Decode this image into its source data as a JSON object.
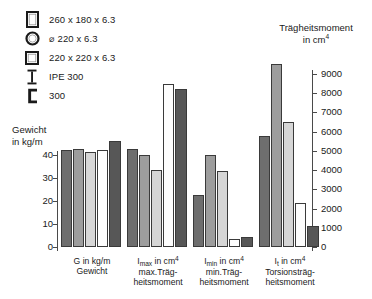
{
  "legend": {
    "items": [
      {
        "icon": "rect-hollow-tube-icon",
        "label": "260 x 180 x 6.3"
      },
      {
        "icon": "round-hollow-tube-icon",
        "label": "⌀ 220 x 6.3"
      },
      {
        "icon": "square-hollow-tube-icon",
        "label": "220 x 220 x 6.3"
      },
      {
        "icon": "i-beam-icon",
        "label": "IPE 300"
      },
      {
        "icon": "c-channel-icon",
        "label": "300"
      }
    ]
  },
  "axes": {
    "left": {
      "title_line1": "Gewicht",
      "title_line2": "in kg/m",
      "ticks": [
        "0",
        "10",
        "20",
        "30",
        "40"
      ],
      "values": [
        0,
        10,
        20,
        30,
        40
      ],
      "min": 0,
      "max": 48
    },
    "right": {
      "title_line1": "Trägheitsmoment",
      "title_line2": "in cm",
      "title_exponent": "4",
      "ticks": [
        "0",
        "1000",
        "2000",
        "3000",
        "4000",
        "5000",
        "6000",
        "7000",
        "8000",
        "9000"
      ],
      "values": [
        0,
        1000,
        2000,
        3000,
        4000,
        5000,
        6000,
        7000,
        8000,
        9000
      ],
      "min": 0,
      "max": 10000
    }
  },
  "colors": {
    "series": [
      "#6e6e6e",
      "#9d9d9d",
      "#d6d6d6",
      "#fdfdfd",
      "#575757"
    ],
    "stroke": "#3a3a3a",
    "axis": "#4a4a4a"
  },
  "chart_data": {
    "type": "bar",
    "title": "",
    "xlabel": "",
    "ylabel": "Gewicht in kg/m",
    "ylabel_secondary": "Trägheitsmoment in cm⁴",
    "grid": false,
    "legend_position": "top-left",
    "ylim": [
      0,
      48
    ],
    "ylim_secondary": [
      0,
      10000
    ],
    "categories": [
      "G in kg/m Gewicht",
      "Imax in cm4 max.Trägheitsmoment",
      "Imin in cm4 min.Trägheitsmoment",
      "It in cm4 Torsionsträgheitsmoment"
    ],
    "category_labels": [
      {
        "sym": "G",
        "sub": "",
        "unit": " in kg/m",
        "line2": "Gewicht",
        "line3": ""
      },
      {
        "sym": "I",
        "sub": "max",
        "unit": " in cm",
        "exp": "4",
        "line2": "max.Träg-",
        "line3": "heitsmoment"
      },
      {
        "sym": "I",
        "sub": "min",
        "unit": " in cm",
        "exp": "4",
        "line2": "min.Träg-",
        "line3": "heitsmoment"
      },
      {
        "sym": "I",
        "sub": "t",
        "unit": " in cm",
        "exp": "4",
        "line2": "Torsionsträg-",
        "line3": "heitsmoment"
      }
    ],
    "series": [
      {
        "name": "260 x 180 x 6.3",
        "values": [
          42.4,
          5100,
          2700,
          5800
        ],
        "axis": [
          "left",
          "right",
          "right",
          "right"
        ]
      },
      {
        "name": "⌀ 220 x 6.3",
        "values": [
          42.6,
          4800,
          4800,
          9500
        ],
        "axis": [
          "left",
          "right",
          "right",
          "right"
        ]
      },
      {
        "name": "220 x 220 x 6.3",
        "values": [
          41.2,
          4000,
          3950,
          6500
        ],
        "axis": [
          "left",
          "right",
          "right",
          "right"
        ]
      },
      {
        "name": "IPE 300",
        "values": [
          42.2,
          8500,
          400,
          2300
        ],
        "axis": [
          "left",
          "right",
          "right",
          "right"
        ]
      },
      {
        "name": "300",
        "values": [
          46.2,
          8200,
          500,
          1100
        ],
        "axis": [
          "left",
          "right",
          "right",
          "right"
        ]
      }
    ]
  }
}
